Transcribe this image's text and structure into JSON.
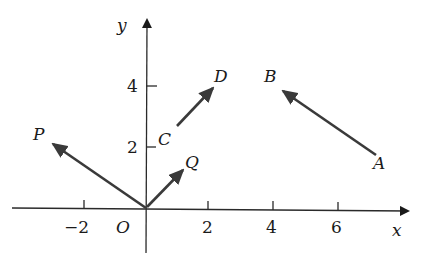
{
  "diagram": {
    "type": "vector-plane",
    "axes": {
      "x_label": "x",
      "y_label": "y",
      "origin_label": "O",
      "x_ticks": [
        {
          "value": -2,
          "label": "−2"
        },
        {
          "value": 2,
          "label": "2"
        },
        {
          "value": 4,
          "label": "4"
        },
        {
          "value": 6,
          "label": "6"
        }
      ],
      "y_ticks": [
        {
          "value": 2,
          "label": "2"
        },
        {
          "value": 4,
          "label": "4"
        }
      ]
    },
    "vectors": [
      {
        "name": "OP",
        "from_label": "O",
        "to_label": "P",
        "from": [
          0,
          0
        ],
        "to": [
          -3,
          2
        ]
      },
      {
        "name": "OQ",
        "from_label": "O",
        "to_label": "Q",
        "from": [
          0,
          0
        ],
        "to": [
          1,
          1
        ]
      },
      {
        "name": "CD",
        "from_label": "C",
        "to_label": "D",
        "from": [
          1,
          2.5
        ],
        "to": [
          2,
          4
        ]
      },
      {
        "name": "AB",
        "from_label": "A",
        "to_label": "B",
        "from": [
          7,
          2
        ],
        "to": [
          4,
          4
        ]
      }
    ],
    "point_labels": {
      "P": "P",
      "Q": "Q",
      "C": "C",
      "D": "D",
      "A": "A",
      "B": "B"
    },
    "colors": {
      "axis": "#2a2a2a",
      "vector": "#3a3a3a",
      "text": "#1a1a1a"
    }
  }
}
